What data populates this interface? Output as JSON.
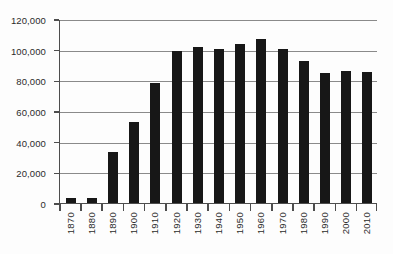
{
  "chart_data": {
    "type": "bar",
    "title": "",
    "subtitle": "",
    "xlabel": "",
    "ylabel": "",
    "categories": [
      "1870",
      "1880",
      "1890",
      "1900",
      "1910",
      "1920",
      "1930",
      "1940",
      "1950",
      "1960",
      "1970",
      "1980",
      "1990",
      "2000",
      "2010"
    ],
    "values": [
      3000,
      3000,
      33000,
      53000,
      78500,
      99000,
      101500,
      100500,
      104000,
      107000,
      100500,
      92500,
      85000,
      86000,
      85500
    ],
    "series": [
      {
        "name": "Population",
        "values": [
          3000,
          3000,
          33000,
          53000,
          78500,
          99000,
          101500,
          100500,
          104000,
          107000,
          100500,
          92500,
          85000,
          86000,
          85500
        ]
      }
    ],
    "ylim": [
      0,
      120000
    ],
    "ytick_values": [
      0,
      20000,
      40000,
      60000,
      80000,
      100000,
      120000
    ],
    "ytick_labels": [
      "0",
      "20,000",
      "40,000",
      "60,000",
      "80,000",
      "100,000",
      "120,000"
    ],
    "grid": true,
    "grid_axis": "y",
    "legend": false,
    "legend_position": "none",
    "annotations": [],
    "bar_color": "#171717",
    "gridline_color": "#8a8a8a",
    "axis_color": "#4d4d4d",
    "background_color": "#fdfdfd"
  }
}
